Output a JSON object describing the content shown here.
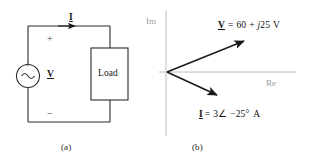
{
  "figure": {
    "panels": [
      {
        "caption": "(a)",
        "description": "ac circuit with source and load"
      },
      {
        "caption": "(b)",
        "description": "phasor diagram in complex plane"
      }
    ]
  },
  "circuit": {
    "source": {
      "name": "ac-voltage-source",
      "plus_sign": "+",
      "minus_sign": "−",
      "waveform": "sine"
    },
    "load": {
      "label": "Load"
    },
    "current_label": "I",
    "voltage_label": "V",
    "terminal_plus": "+",
    "terminal_minus": "−"
  },
  "phasor": {
    "axes": {
      "imaginary_label": "Im",
      "real_label": "Re",
      "axis_color": "#b8b8b8"
    },
    "vectors": [
      {
        "name": "voltage-phasor",
        "symbol": "V",
        "equation_text": "= 60 + j25 V",
        "equation_parts": {
          "prefix": "=",
          "real": "60",
          "sign": "+",
          "imag_unit": "j",
          "imag": "25",
          "unit": "V"
        },
        "angle_deg": 22,
        "length_px": 83
      },
      {
        "name": "current-phasor",
        "symbol": "I",
        "equation_text": "= 3∠ −25° A",
        "equation_parts": {
          "prefix": "=",
          "magnitude": "3",
          "angle_glyph": "∠",
          "angle": "−25°",
          "unit": "A"
        },
        "angle_deg": -25,
        "length_px": 55
      }
    ]
  },
  "colors": {
    "ink": "#1a1a1a",
    "axis_gray": "#b8b8b8",
    "label_gray": "#9b9b9b"
  }
}
